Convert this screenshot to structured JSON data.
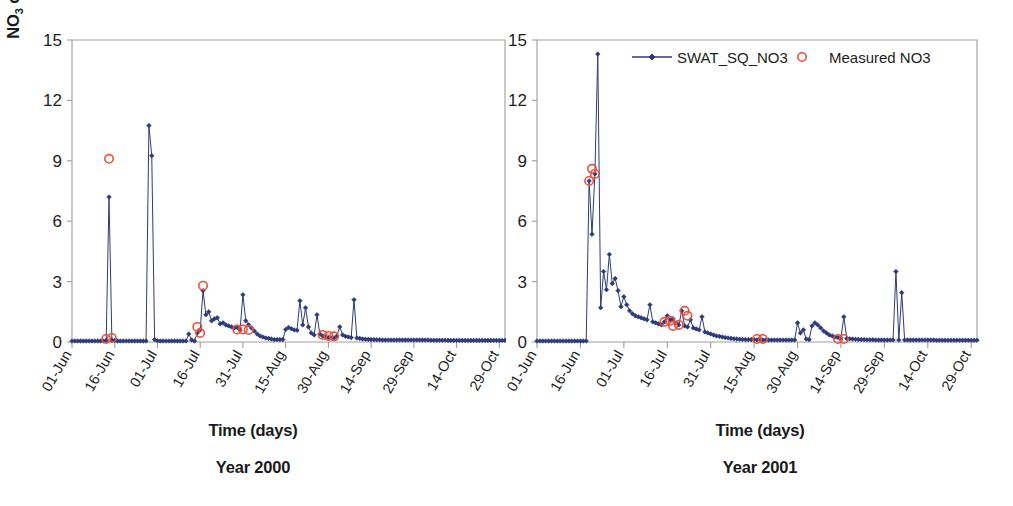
{
  "figure": {
    "background": "#ffffff",
    "series_color": "#2e3a7a",
    "measured_color": "#e8523f",
    "axis_color": "#9d9d9c"
  },
  "legend": {
    "position": "top-right-of-right-panel",
    "items": [
      {
        "label": "SWAT_SQ_NO3",
        "marker": "line-with-diamond",
        "color": "#2e3a7a"
      },
      {
        "label": "Measured NO3",
        "marker": "open-circle",
        "color": "#e8523f"
      }
    ]
  },
  "panels": [
    {
      "id": "left",
      "year_caption": "Year 2000",
      "xlabel": "Time (days)",
      "ylabel": "NO3 concentration (mg/l)"
    },
    {
      "id": "right",
      "year_caption": "Year 2001",
      "xlabel": "Time (days)",
      "ylabel": "NO3 concentration (mg/l)"
    }
  ],
  "chart_data": [
    {
      "type": "line",
      "panel": "left",
      "title": "Year 2000",
      "xlabel": "Time (days)",
      "ylabel": "NO3 concentration (mg/l)",
      "ylim": [
        0,
        15
      ],
      "yticks": [
        0,
        3,
        6,
        9,
        12,
        15
      ],
      "xticks": [
        "01-Jun",
        "16-Jun",
        "01-Jul",
        "16-Jul",
        "31-Jul",
        "15-Aug",
        "30-Aug",
        "14-Sep",
        "29-Sep",
        "14-Oct",
        "29-Oct"
      ],
      "xtick_day_index": [
        0,
        15,
        30,
        45,
        60,
        75,
        90,
        105,
        120,
        135,
        150
      ],
      "x_range_days": [
        0,
        152
      ],
      "grid": false,
      "legend_position": "top-right",
      "series": [
        {
          "name": "SWAT_SQ_NO3",
          "color": "#2e3a7a",
          "marker": "diamond",
          "values": [
            0.05,
            0.05,
            0.05,
            0.05,
            0.05,
            0.05,
            0.05,
            0.05,
            0.05,
            0.05,
            0.05,
            0.05,
            0.08,
            7.2,
            0.1,
            0.08,
            0.05,
            0.05,
            0.05,
            0.05,
            0.05,
            0.05,
            0.05,
            0.05,
            0.05,
            0.05,
            0.05,
            10.75,
            9.25,
            0.12,
            0.06,
            0.05,
            0.05,
            0.05,
            0.05,
            0.05,
            0.05,
            0.05,
            0.05,
            0.05,
            0.05,
            0.4,
            0.1,
            0.05,
            0.45,
            0.6,
            2.55,
            1.35,
            1.5,
            1.05,
            1.15,
            1.2,
            0.9,
            0.95,
            0.85,
            0.8,
            0.75,
            0.7,
            0.72,
            0.6,
            2.35,
            1.05,
            0.85,
            0.7,
            0.55,
            0.4,
            0.3,
            0.25,
            0.2,
            0.18,
            0.15,
            0.12,
            0.12,
            0.12,
            0.12,
            0.62,
            0.72,
            0.66,
            0.6,
            0.58,
            2.05,
            0.85,
            1.7,
            0.75,
            0.45,
            0.35,
            1.35,
            0.4,
            0.3,
            0.25,
            0.22,
            0.2,
            0.2,
            0.3,
            0.75,
            0.35,
            0.28,
            0.25,
            0.22,
            2.1,
            0.2,
            0.18,
            0.15,
            0.14,
            0.13,
            0.12,
            0.12,
            0.11,
            0.11,
            0.1,
            0.1,
            0.1,
            0.1,
            0.1,
            0.1,
            0.1,
            0.1,
            0.1,
            0.1,
            0.1,
            0.1,
            0.1,
            0.1,
            0.1,
            0.1,
            0.1,
            0.09,
            0.09,
            0.09,
            0.09,
            0.09,
            0.09,
            0.08,
            0.08,
            0.08,
            0.08,
            0.08,
            0.08,
            0.08,
            0.08,
            0.08,
            0.08,
            0.08,
            0.08,
            0.08,
            0.08,
            0.08,
            0.08,
            0.08,
            0.08,
            0.08,
            0.08,
            0.08
          ]
        },
        {
          "name": "Measured NO3",
          "color": "#e8523f",
          "marker": "open-circle",
          "points": [
            {
              "x": 13,
              "y": 9.1
            },
            {
              "x": 12,
              "y": 0.15
            },
            {
              "x": 14,
              "y": 0.2
            },
            {
              "x": 44,
              "y": 0.75
            },
            {
              "x": 45,
              "y": 0.45
            },
            {
              "x": 46,
              "y": 2.8
            },
            {
              "x": 58,
              "y": 0.62
            },
            {
              "x": 60,
              "y": 0.62
            },
            {
              "x": 62,
              "y": 0.6
            },
            {
              "x": 88,
              "y": 0.35
            },
            {
              "x": 90,
              "y": 0.3
            },
            {
              "x": 92,
              "y": 0.28
            }
          ]
        }
      ]
    },
    {
      "type": "line",
      "panel": "right",
      "title": "Year 2001",
      "xlabel": "Time (days)",
      "ylabel": "NO3 concentration (mg/l)",
      "ylim": [
        0,
        15
      ],
      "yticks": [
        0,
        3,
        6,
        9,
        12,
        15
      ],
      "xticks": [
        "01-Jun",
        "16-Jun",
        "01-Jul",
        "16-Jul",
        "31-Jul",
        "15-Aug",
        "30-Aug",
        "14-Sep",
        "29-Sep",
        "14-Oct",
        "29-Oct"
      ],
      "xtick_day_index": [
        0,
        15,
        30,
        45,
        60,
        75,
        90,
        105,
        120,
        135,
        150
      ],
      "x_range_days": [
        0,
        152
      ],
      "grid": false,
      "legend_position": "top-right",
      "series": [
        {
          "name": "SWAT_SQ_NO3",
          "color": "#2e3a7a",
          "marker": "diamond",
          "values": [
            0.05,
            0.05,
            0.05,
            0.05,
            0.05,
            0.05,
            0.05,
            0.05,
            0.05,
            0.05,
            0.05,
            0.05,
            0.05,
            0.05,
            0.05,
            0.05,
            0.05,
            0.05,
            8.0,
            5.35,
            8.35,
            14.3,
            1.7,
            3.5,
            2.6,
            4.35,
            2.9,
            3.15,
            2.55,
            1.75,
            2.25,
            1.85,
            1.55,
            1.4,
            1.3,
            1.25,
            1.2,
            1.15,
            1.1,
            1.85,
            1.0,
            0.95,
            0.9,
            0.85,
            1.0,
            1.3,
            1.1,
            1.15,
            0.95,
            0.85,
            1.55,
            0.8,
            0.75,
            1.1,
            0.7,
            0.65,
            0.6,
            1.25,
            0.5,
            0.45,
            0.4,
            0.35,
            0.3,
            0.28,
            0.25,
            0.22,
            0.2,
            0.18,
            0.16,
            0.15,
            0.14,
            0.13,
            0.12,
            0.12,
            0.12,
            0.11,
            0.11,
            0.11,
            0.1,
            0.1,
            0.1,
            0.1,
            0.1,
            0.1,
            0.1,
            0.1,
            0.1,
            0.1,
            0.1,
            0.1,
            0.95,
            0.45,
            0.6,
            0.15,
            0.12,
            0.8,
            0.95,
            0.85,
            0.7,
            0.55,
            0.45,
            0.35,
            0.3,
            0.25,
            0.22,
            0.2,
            1.25,
            0.18,
            0.16,
            0.15,
            0.14,
            0.13,
            0.12,
            0.12,
            0.11,
            0.11,
            0.11,
            0.1,
            0.1,
            0.1,
            0.1,
            0.1,
            0.1,
            0.1,
            3.5,
            0.1,
            2.45,
            0.1,
            0.1,
            0.1,
            0.1,
            0.1,
            0.1,
            0.1,
            0.1,
            0.1,
            0.1,
            0.1,
            0.09,
            0.09,
            0.09,
            0.09,
            0.09,
            0.09,
            0.09,
            0.09,
            0.09,
            0.09,
            0.09,
            0.09,
            0.09,
            0.09,
            0.09
          ]
        },
        {
          "name": "Measured NO3",
          "color": "#e8523f",
          "marker": "open-circle",
          "points": [
            {
              "x": 18,
              "y": 8.0
            },
            {
              "x": 19,
              "y": 8.6
            },
            {
              "x": 20,
              "y": 8.35
            },
            {
              "x": 44,
              "y": 1.0
            },
            {
              "x": 46,
              "y": 1.05
            },
            {
              "x": 47,
              "y": 0.8
            },
            {
              "x": 49,
              "y": 0.85
            },
            {
              "x": 51,
              "y": 1.55
            },
            {
              "x": 52,
              "y": 1.3
            },
            {
              "x": 76,
              "y": 0.15
            },
            {
              "x": 78,
              "y": 0.15
            },
            {
              "x": 104,
              "y": 0.15
            },
            {
              "x": 106,
              "y": 0.15
            }
          ]
        }
      ]
    }
  ]
}
